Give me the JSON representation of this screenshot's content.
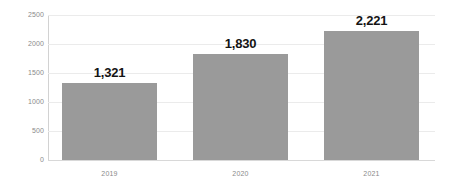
{
  "chart_data": {
    "type": "bar",
    "title": "",
    "subtitle": "",
    "xlabel": "",
    "ylabel": "",
    "categories": [
      "2019",
      "2020",
      "2021"
    ],
    "values": [
      1321,
      1830,
      2221
    ],
    "data_labels": [
      "1,321",
      "1,830",
      "2,221"
    ],
    "ylim": [
      0,
      2500
    ],
    "yticks": [
      0,
      500,
      1000,
      1500,
      2000,
      2500
    ],
    "ytick_labels": [
      "0",
      "500",
      "1000",
      "1500",
      "2000",
      "2500"
    ],
    "grid": "horizontal",
    "legend": "none",
    "series": [
      {
        "name": "",
        "values": [
          1321,
          1830,
          2221
        ],
        "color": "#9a9a9a"
      }
    ],
    "colors": {
      "bar": "#9a9a9a",
      "gridline": "#ebebeb",
      "axis": "#d2d2d2",
      "tick_label": "#8a8a8a",
      "data_label": "#141414",
      "background": "#ffffff"
    }
  }
}
